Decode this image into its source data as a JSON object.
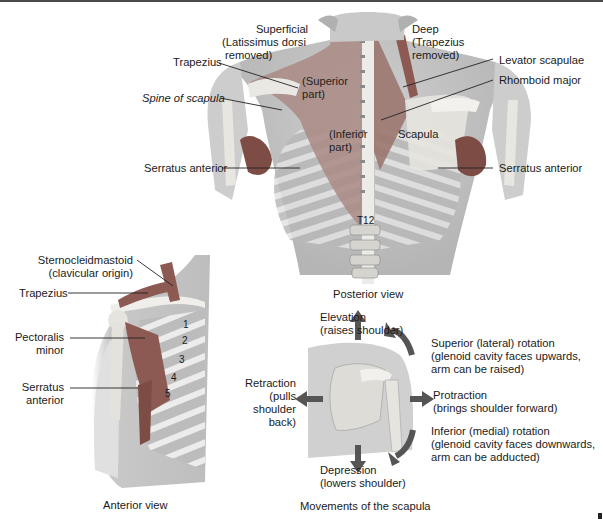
{
  "posterior": {
    "caption": "Posterior view",
    "superficial": [
      "Superficial",
      "(Latissimus dorsi",
      "removed)"
    ],
    "deep": [
      "Deep",
      "(Trapezius",
      "removed)"
    ],
    "trapezius": "Trapezius",
    "spine_of_scapula": "Spine of scapula",
    "serratus_left": "Serratus anterior",
    "serratus_right": "Serratus anterior",
    "superior_part": [
      "(Superior",
      "part)"
    ],
    "inferior_part": [
      "(Inferior",
      "part)"
    ],
    "scapula": "Scapula",
    "levator_scapulae": "Levator scapulae",
    "rhomboid_major": "Rhomboid major",
    "t12": "T12"
  },
  "anterior": {
    "caption": "Anterior view",
    "sternocleidomastoid": [
      "Sternocleidmastoid",
      "(clavicular origin)"
    ],
    "trapezius": "Trapezius",
    "pectoralis_minor": [
      "Pectoralis",
      "minor"
    ],
    "serratus_anterior": [
      "Serratus",
      "anterior"
    ],
    "ribs": [
      "1",
      "2",
      "3",
      "4",
      "5"
    ]
  },
  "movements": {
    "caption": "Movements of the scapula",
    "elevation": [
      "Elevation",
      "(raises shoulder)"
    ],
    "depression": [
      "Depression",
      "(lowers shoulder)"
    ],
    "retraction": [
      "Retraction",
      "(pulls",
      "shoulder",
      "back)"
    ],
    "protraction": [
      "Protraction",
      "(brings shoulder forward)"
    ],
    "superior_rotation": [
      "Superior (lateral) rotation",
      "(glenoid cavity faces upwards,",
      "arm can be raised)"
    ],
    "inferior_rotation": [
      "Inferior (medial) rotation",
      "(glenoid cavity faces downwards,",
      "arm can be adducted)"
    ]
  },
  "colors": {
    "muscle": "#8c5a52",
    "bone": "#e6e4df",
    "skin": "#d2d2d2",
    "arrow": "#555555",
    "leader": "#222222"
  }
}
